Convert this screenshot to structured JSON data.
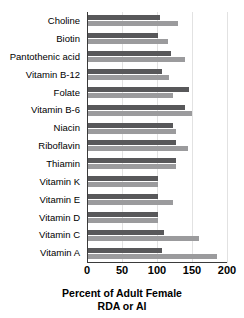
{
  "chart_data": {
    "type": "bar",
    "orientation": "horizontal",
    "title": "",
    "xlabel": "Percent of Adult Female RDA or AI",
    "xlabel_line1": "Percent of Adult Female",
    "xlabel_line2": "RDA or AI",
    "ylabel": "",
    "xlim": [
      0,
      200
    ],
    "xticks": [
      0,
      50,
      100,
      150,
      200
    ],
    "xtick_labels": [
      "0",
      "50",
      "100",
      "150",
      "200"
    ],
    "grid": true,
    "legend": "none",
    "categories": [
      "Choline",
      "Biotin",
      "Pantothenic acid",
      "Vitamin B-12",
      "Folate",
      "Vitamin B-6",
      "Niacin",
      "Riboflavin",
      "Thiamin",
      "Vitamin K",
      "Vitamin E",
      "Vitamin D",
      "Vitamin C",
      "Vitamin A"
    ],
    "series": [
      {
        "name": "series-dark",
        "color": "#58585a",
        "values": [
          103,
          100,
          119,
          106,
          146,
          139,
          122,
          126,
          127,
          100,
          100,
          100,
          109,
          107
        ]
      },
      {
        "name": "series-light",
        "color": "#9b9b9d",
        "values": [
          129,
          115,
          140,
          116,
          122,
          150,
          127,
          144,
          126,
          100,
          122,
          100,
          160,
          186
        ]
      }
    ]
  },
  "colors": {
    "dark_bar": "#58585a",
    "light_bar": "#9b9b9d",
    "axis": "#3b3b3b",
    "grid": "#e2e2e2",
    "background": "#ffffff",
    "text": "#000000"
  }
}
